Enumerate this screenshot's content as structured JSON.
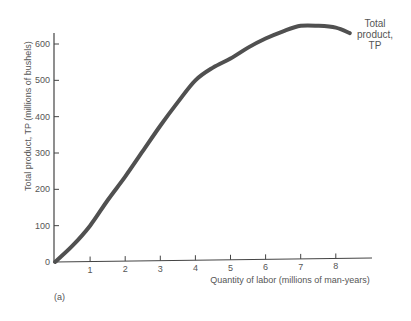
{
  "chart_data": {
    "type": "line",
    "title": "",
    "panel_label": "(a)",
    "xlabel": "Quantity of labor (millions of man-years)",
    "ylabel": "Total product, TP (millions of bushels)",
    "xlim": [
      0,
      8.6
    ],
    "ylim": [
      0,
      650
    ],
    "x_ticks": [
      1,
      2,
      3,
      4,
      5,
      6,
      7,
      8
    ],
    "y_ticks": [
      0,
      100,
      200,
      300,
      400,
      500,
      600
    ],
    "grid": false,
    "legend": "none",
    "series": [
      {
        "name": "Total product, TP",
        "label_lines": [
          "Total",
          "product,",
          "TP"
        ],
        "x": [
          0,
          0.5,
          1,
          1.5,
          2,
          2.5,
          3,
          3.5,
          4,
          4.5,
          5,
          5.5,
          6,
          6.5,
          7,
          7.5,
          8,
          8.4
        ],
        "values": [
          0,
          45,
          100,
          170,
          235,
          305,
          375,
          440,
          500,
          535,
          560,
          590,
          615,
          635,
          650,
          650,
          645,
          630
        ]
      }
    ]
  },
  "colors": {
    "curve": "#505050",
    "axis": "#444444",
    "text": "#555555"
  }
}
